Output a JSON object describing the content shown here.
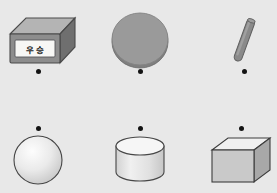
{
  "scene": {
    "background_color": "#e8e8e8",
    "width": 277,
    "height": 193,
    "rows": 2,
    "columns": 3
  },
  "palette": {
    "background": "#e8e8e8",
    "dot": "#131313",
    "box_front": "#8d8d8d",
    "box_top": "#b4b4b4",
    "box_side": "#6f6f6f",
    "box_outline": "#4a4a4a",
    "label_bg": "#f7f7f5",
    "label_text": "#1a1a1a",
    "puck_fill": "#9a9a9a",
    "puck_rim": "#7d7d7d",
    "rod_fill": "#8a8a8a",
    "rod_dark": "#6b6b6b",
    "sphere_light": "#fbfbfb",
    "sphere_dark": "#c9c9c9",
    "cylinder_top": "#f2f2f2",
    "cylinder_body": "#dedede",
    "cube_top": "#f0f0f0",
    "cube_front": "#c9c9c9",
    "cube_side": "#a8a8a8",
    "outline": "#3c3c3c"
  },
  "objects": [
    {
      "id": "box",
      "name": "labeled-box",
      "shape": "rectangular-box",
      "row": 1,
      "column": 1,
      "dot_position": "below",
      "dot_x": 38,
      "dot_y": 71,
      "label": {
        "present": true,
        "text": "우 승",
        "characters": [
          "우",
          "승"
        ],
        "background": "#f7f7f5"
      }
    },
    {
      "id": "puck",
      "name": "flat-disc",
      "shape": "disc",
      "row": 1,
      "column": 2,
      "dot_position": "below",
      "dot_x": 140,
      "dot_y": 71,
      "label": {
        "present": false,
        "text": ""
      }
    },
    {
      "id": "rod",
      "name": "tilted-rod",
      "shape": "rod",
      "row": 1,
      "column": 3,
      "dot_position": "below",
      "dot_x": 244,
      "dot_y": 71,
      "label": {
        "present": false,
        "text": ""
      }
    },
    {
      "id": "sphere",
      "name": "sphere",
      "shape": "sphere",
      "row": 2,
      "column": 1,
      "dot_position": "above",
      "dot_x": 38,
      "dot_y": 128,
      "label": {
        "present": false,
        "text": ""
      }
    },
    {
      "id": "cylinder",
      "name": "upright-cylinder",
      "shape": "cylinder",
      "row": 2,
      "column": 2,
      "dot_position": "above",
      "dot_x": 140,
      "dot_y": 128,
      "label": {
        "present": false,
        "text": ""
      }
    },
    {
      "id": "cube",
      "name": "cube",
      "shape": "cube",
      "row": 2,
      "column": 3,
      "dot_position": "above",
      "dot_x": 241,
      "dot_y": 128,
      "label": {
        "present": false,
        "text": ""
      }
    }
  ]
}
